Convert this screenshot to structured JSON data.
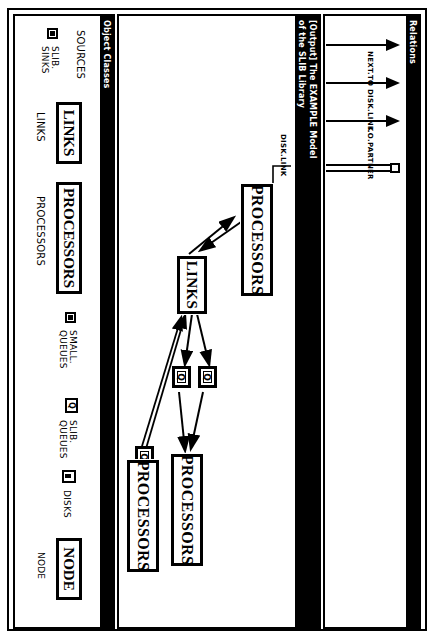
{
  "window": {
    "panels": {
      "relations": {
        "title": "Relations",
        "items": [
          {
            "label": "NEXT.TO",
            "x": 28
          },
          {
            "label": "DISK.LINK",
            "x": 66
          },
          {
            "label": "I.O.PARTNER",
            "x": 104
          }
        ],
        "double_connector": {
          "name": "unlabeled-pair-connector",
          "x": 148
        }
      },
      "canvas": {
        "title_line1": "[Output] The EXAMPLE Model",
        "title_line2": "of the SLIB Library",
        "nodes": [
          {
            "id": "proc-top",
            "type": "box",
            "label": "PROCESSORS",
            "x": 168,
            "y": 22
          },
          {
            "id": "links",
            "type": "box",
            "label": "LINKS",
            "x": 238,
            "y": 88
          },
          {
            "id": "q-upper",
            "type": "queue",
            "label": "Q",
            "x": 352,
            "y": 80
          },
          {
            "id": "q-lower",
            "type": "queue",
            "label": "Q",
            "x": 352,
            "y": 104
          },
          {
            "id": "proc-right",
            "type": "box",
            "label": "PROCESSORS",
            "x": 438,
            "y": 88
          },
          {
            "id": "q-free-a",
            "type": "queue",
            "label": "Q",
            "x": 432,
            "y": 146
          },
          {
            "id": "q-free-b",
            "type": "queue",
            "label": "Q",
            "x": 460,
            "y": 146
          },
          {
            "id": "proc-bottom",
            "type": "box",
            "label": "PROCESSORS",
            "x": 430,
            "y": 132
          }
        ],
        "edge_labels": [
          {
            "label": "DISK.LINK",
            "x": 120,
            "y": 10
          }
        ]
      },
      "object_classes": {
        "title": "Object Classes",
        "items": [
          {
            "icon": "none",
            "name": "SOURCES",
            "style": "plain"
          },
          {
            "icon": "sink-icon",
            "name": "SLIB.\nSINKS",
            "style": "plain"
          },
          {
            "icon": "none",
            "name": "LINKS",
            "style": "boxed"
          },
          {
            "icon": "none",
            "name": "LINKS",
            "style": "plain"
          },
          {
            "icon": "none",
            "name": "PROCESSORS",
            "style": "boxed"
          },
          {
            "icon": "none",
            "name": "PROCESSORS",
            "style": "plain"
          },
          {
            "icon": "queue-icon",
            "name": "SMALL.\nQUEUES",
            "style": "plain"
          },
          {
            "icon": "queue-icon",
            "name": "SLIB.\nQUEUES",
            "style": "plain"
          },
          {
            "icon": "disk-icon",
            "name": "DISKS",
            "style": "plain"
          },
          {
            "icon": "none",
            "name": "NODE",
            "style": "boxed"
          },
          {
            "icon": "none",
            "name": "NODE",
            "style": "plain"
          }
        ]
      }
    }
  },
  "colors": {
    "ink": "#000000",
    "paper": "#ffffff",
    "titlebar_bg": "#000000",
    "titlebar_fg": "#ffffff"
  }
}
